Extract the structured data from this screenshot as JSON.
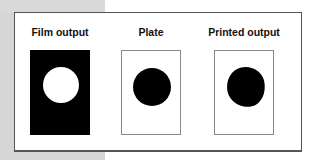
{
  "diagram": {
    "panels": [
      {
        "id": "film",
        "label": "Film output",
        "fill": "#000000",
        "dot_color": "#ffffff",
        "description": "Black film with white (clear) circle"
      },
      {
        "id": "plate",
        "label": "Plate",
        "fill": "#ffffff",
        "dot_color": "#000000",
        "description": "White plate with black circle"
      },
      {
        "id": "print",
        "label": "Printed output",
        "fill": "#ffffff",
        "dot_color": "#000000",
        "description": "White paper with slightly irregular black dot"
      }
    ]
  }
}
